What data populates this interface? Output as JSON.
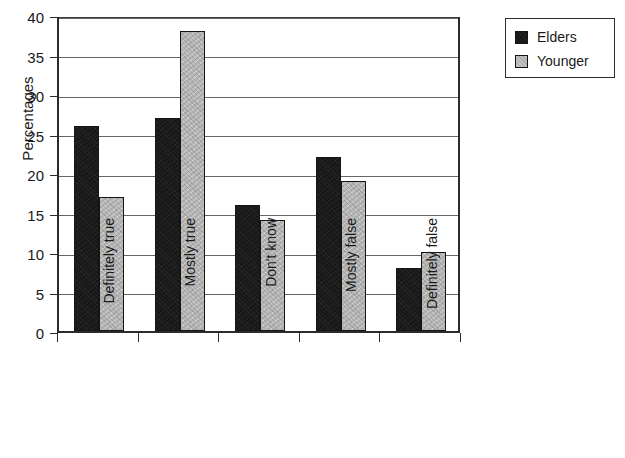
{
  "chart_data": {
    "type": "bar",
    "title": "",
    "subtitle": "",
    "xlabel": "",
    "ylabel": "Percentages",
    "categories": [
      "Definitely true",
      "Mostly true",
      "Don't know",
      "Mostly false",
      "Definitely false"
    ],
    "series": [
      {
        "name": "Elders",
        "values": [
          26,
          27,
          16,
          22,
          8
        ],
        "color": "#171717"
      },
      {
        "name": "Younger",
        "values": [
          17,
          38,
          14,
          19,
          10
        ],
        "color": "#b4b4b4"
      }
    ],
    "ylim": [
      0,
      40
    ],
    "ytick_labels": [
      "0",
      "5",
      "10",
      "15",
      "20",
      "25",
      "30",
      "35",
      "40"
    ],
    "ytick_values": [
      0,
      5,
      10,
      15,
      20,
      25,
      30,
      35,
      40
    ],
    "grid": "horizontal",
    "legend_position": "top-right",
    "xtick_label_rotation": "-90"
  },
  "legend": {
    "entries": [
      {
        "label": "Elders"
      },
      {
        "label": "Younger"
      }
    ]
  }
}
